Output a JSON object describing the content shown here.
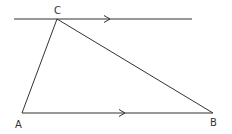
{
  "diagram": {
    "type": "geometry",
    "points": {
      "A": {
        "label": "A",
        "x": 22,
        "y": 113
      },
      "B": {
        "label": "B",
        "x": 213,
        "y": 113
      },
      "C": {
        "label": "C",
        "x": 57,
        "y": 19
      }
    },
    "segments": [
      {
        "from": "A",
        "to": "B",
        "arrow": true
      },
      {
        "from": "A",
        "to": "C",
        "arrow": false
      },
      {
        "from": "C",
        "to": "B",
        "arrow": false
      },
      {
        "name": "parallel-line-through-C",
        "x1": 14,
        "x2": 192,
        "y": 19,
        "arrow": true
      }
    ],
    "stroke_color": "#333333"
  }
}
